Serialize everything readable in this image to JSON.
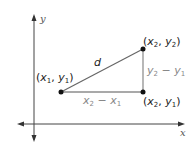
{
  "diagram": {
    "axes": {
      "x_label": "x",
      "y_label": "y"
    },
    "points": [
      {
        "id": "p1",
        "label_var_x": "x",
        "label_sub_x": "1",
        "label_var_y": "y",
        "label_sub_y": "1"
      },
      {
        "id": "p2",
        "label_var_x": "x",
        "label_sub_x": "2",
        "label_var_y": "y",
        "label_sub_y": "2"
      },
      {
        "id": "p3",
        "label_var_x": "x",
        "label_sub_x": "2",
        "label_var_y": "y",
        "label_sub_y": "1"
      }
    ],
    "hypotenuse_label": "d",
    "horizontal_leg": {
      "a": "x",
      "a_sub": "2",
      "op": " − ",
      "b": "x",
      "b_sub": "1"
    },
    "vertical_leg": {
      "a": "y",
      "a_sub": "2",
      "op": " − ",
      "b": "y",
      "b_sub": "1"
    },
    "colors": {
      "axis": "#333333",
      "line": "#666666",
      "point": "#111111",
      "label": "#222222",
      "leg_label": "#888888"
    }
  }
}
